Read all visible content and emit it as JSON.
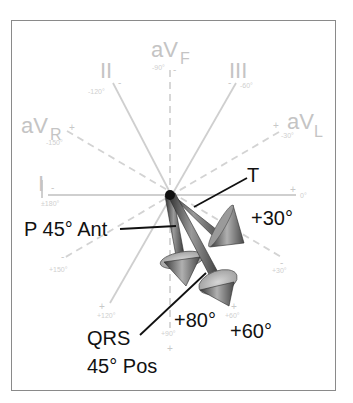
{
  "diagram": {
    "type": "hexaxial-reference-with-3d-vectors",
    "leads": [
      {
        "name": "I",
        "label": "I",
        "neg_sign": "-",
        "pos_sign": "+",
        "neg_angle": "±180°",
        "pos_angle": "0°",
        "style": "solid"
      },
      {
        "name": "II",
        "label": "II",
        "neg_sign": "-",
        "pos_sign": "+",
        "neg_angle": "-120°",
        "pos_angle": "+60°",
        "style": "solid"
      },
      {
        "name": "III",
        "label": "III",
        "neg_sign": "-",
        "pos_sign": "+",
        "neg_angle": "-60°",
        "pos_angle": "+120°",
        "style": "solid"
      },
      {
        "name": "aVR",
        "label_main": "aV",
        "label_sub": "R",
        "neg_sign": "-",
        "pos_sign": "+",
        "pos_angle": "-150°",
        "neg_angle": "+30°",
        "style": "dashed"
      },
      {
        "name": "aVL",
        "label_main": "aV",
        "label_sub": "L",
        "neg_sign": "-",
        "pos_sign": "+",
        "pos_angle": "-30°",
        "neg_angle": "+150°",
        "style": "dashed"
      },
      {
        "name": "aVF",
        "label_main": "aV",
        "label_sub": "F",
        "neg_sign": "-",
        "pos_sign": "+",
        "neg_angle": "-90°",
        "pos_angle": "+90°",
        "style": "dashed"
      }
    ],
    "vectors": [
      {
        "name": "T",
        "label": "T",
        "frontal_angle": "+30°"
      },
      {
        "name": "P",
        "label": "P 45° Ant",
        "frontal_angle": "+80°"
      },
      {
        "name": "QRS",
        "label_line1": "QRS",
        "label_line2": "45° Pos",
        "frontal_angle": "+60°"
      }
    ],
    "angle_labels": {
      "t_angle": "+30°",
      "p_angle": "+80°",
      "qrs_angle": "+60°"
    },
    "colors": {
      "axis": "#cfcfcf",
      "text": "#111111",
      "frame": "#8a8a8a",
      "vector_dark": "#3a3a3a",
      "vector_light": "#bdbdbd"
    }
  }
}
